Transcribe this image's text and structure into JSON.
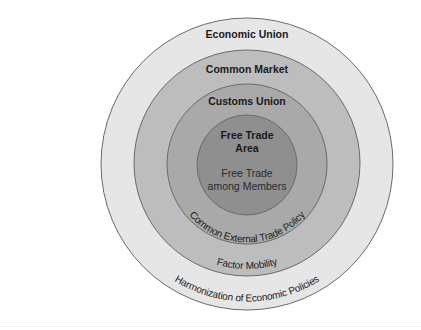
{
  "diagram": {
    "rings": [
      {
        "id": "economic-union",
        "title": "Economic Union",
        "feature": "Harmonization of Economic Policies",
        "fill": "#e6e6e6"
      },
      {
        "id": "common-market",
        "title": "Common Market",
        "feature": "Factor Mobility",
        "fill": "#bdbdbd"
      },
      {
        "id": "customs-union",
        "title": "Customs Union",
        "feature": "Common External Trade Policy",
        "fill": "#a9a9a9"
      },
      {
        "id": "free-trade-area",
        "title_line1": "Free Trade",
        "title_line2": "Area",
        "feature_line1": "Free Trade",
        "feature_line2": "among Members",
        "fill": "#8f8f8f"
      }
    ],
    "colors": {
      "background": "#ffffff",
      "outline": "#6a6a6a",
      "text": "#1a1a1a"
    }
  }
}
